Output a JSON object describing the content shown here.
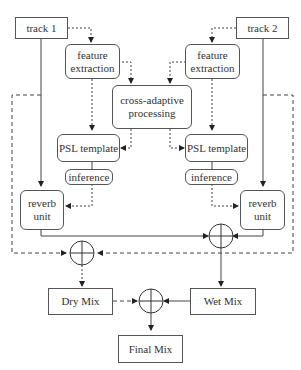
{
  "diagram": {
    "nodes": {
      "track1": "track 1",
      "track2": "track 2",
      "feature_left": "feature\nextraction",
      "feature_right": "feature\nextraction",
      "cross": "cross-adaptive\nprocessing",
      "psl_left": "PSL template",
      "psl_right": "PSL template",
      "inference_left": "inference",
      "inference_right": "inference",
      "reverb_left": "reverb\nunit",
      "reverb_right": "reverb\nunit",
      "dry_mix": "Dry Mix",
      "wet_mix": "Wet Mix",
      "final_mix": "Final Mix"
    },
    "edges": [
      {
        "from": "track 1",
        "to": "feature extraction (left)",
        "style": "dotted"
      },
      {
        "from": "track 2",
        "to": "feature extraction (right)",
        "style": "dotted"
      },
      {
        "from": "feature extraction (left)",
        "to": "cross-adaptive processing",
        "style": "dotted"
      },
      {
        "from": "feature extraction (right)",
        "to": "cross-adaptive processing",
        "style": "dotted"
      },
      {
        "from": "feature extraction (left)",
        "to": "PSL template (left)",
        "style": "dotted"
      },
      {
        "from": "feature extraction (right)",
        "to": "PSL template (right)",
        "style": "dotted"
      },
      {
        "from": "cross-adaptive processing",
        "to": "PSL template (left)",
        "style": "dotted"
      },
      {
        "from": "cross-adaptive processing",
        "to": "PSL template (right)",
        "style": "dotted"
      },
      {
        "from": "inference (left)",
        "to": "reverb unit (left)",
        "style": "dotted"
      },
      {
        "from": "inference (right)",
        "to": "reverb unit (right)",
        "style": "dotted"
      },
      {
        "from": "track 1",
        "to": "reverb unit (left)",
        "style": "solid"
      },
      {
        "from": "track 2",
        "to": "reverb unit (right)",
        "style": "solid"
      },
      {
        "from": "reverb unit (left)",
        "to": "wet sum",
        "style": "solid"
      },
      {
        "from": "reverb unit (right)",
        "to": "wet sum",
        "style": "solid"
      },
      {
        "from": "track 1",
        "to": "dry sum",
        "style": "dashed"
      },
      {
        "from": "track 2",
        "to": "dry sum",
        "style": "dashed"
      },
      {
        "from": "dry sum",
        "to": "Dry Mix",
        "style": "dotted"
      },
      {
        "from": "wet sum",
        "to": "Wet Mix",
        "style": "solid"
      },
      {
        "from": "Dry Mix",
        "to": "final sum",
        "style": "dashed"
      },
      {
        "from": "Wet Mix",
        "to": "final sum",
        "style": "solid"
      },
      {
        "from": "final sum",
        "to": "Final Mix",
        "style": "solid"
      }
    ]
  }
}
